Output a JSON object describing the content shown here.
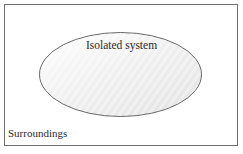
{
  "diagram": {
    "type": "system-and-surroundings",
    "surroundings": {
      "label": "Surroundings",
      "border_color": "#6e6e6e",
      "fill_color": "#ffffff"
    },
    "system": {
      "label": "Isolated system",
      "shape": "ellipse",
      "border_color": "#5a5a5a",
      "fill_color_light": "#fafafa",
      "fill_color_dark": "#e4e4e4"
    }
  }
}
